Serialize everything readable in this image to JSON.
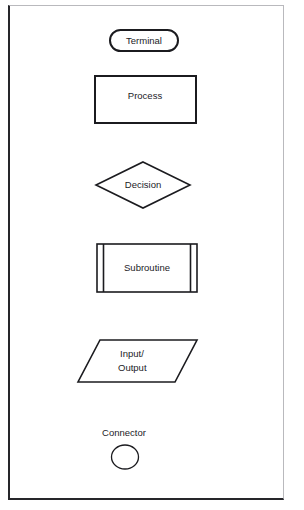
{
  "page": {
    "background_color": "#ffffff",
    "frame_color_dark": "#26262a",
    "frame_color_light": "#b9b9bd",
    "ink_color": "#1b1b1f"
  },
  "diagram": {
    "type": "flowchart-symbol-legend",
    "symbols": [
      {
        "id": "terminal",
        "label": "Terminal",
        "shape": "rounded-rectangle",
        "label_position": "inside"
      },
      {
        "id": "process",
        "label": "Process",
        "shape": "rectangle",
        "label_position": "inside"
      },
      {
        "id": "decision",
        "label": "Decision",
        "shape": "diamond",
        "label_position": "inside"
      },
      {
        "id": "subroutine",
        "label": "Subroutine",
        "shape": "double-sided-rectangle",
        "label_position": "inside"
      },
      {
        "id": "input-output",
        "label_line_1": "Input/",
        "label_line_2": "Output",
        "label": "Input/ Output",
        "shape": "parallelogram",
        "label_position": "inside"
      },
      {
        "id": "connector",
        "label": "Connector",
        "shape": "circle",
        "label_position": "above"
      }
    ]
  }
}
